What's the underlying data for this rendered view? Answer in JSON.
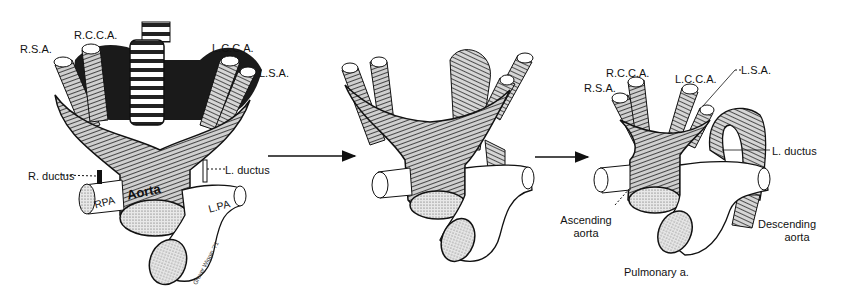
{
  "figure": {
    "panels": [
      {
        "id": "panel-1",
        "labels": {
          "rsa": "R.S.A.",
          "rcca": "R.C.C.A.",
          "lcca": "L.C.C.A.",
          "lsa": "L.S.A.",
          "r_ductus": "R. ductus",
          "l_ductus": "L. ductus",
          "aorta": "Aorta",
          "rpa": "RPA",
          "lpa": "L.PA"
        },
        "signature": "Grover Wiggin '71"
      },
      {
        "id": "panel-2",
        "labels": {}
      },
      {
        "id": "panel-3",
        "labels": {
          "rsa": "R.S.A.",
          "rcca": "R.C.C.A.",
          "lcca": "L.C.C.A.",
          "lsa": "L.S.A.",
          "l_ductus": "L. ductus",
          "ascending_aorta_1": "Ascending",
          "ascending_aorta_2": "aorta",
          "descending_aorta_1": "Descending",
          "descending_aorta_2": "aorta",
          "pulmonary": "Pulmonary a."
        }
      }
    ],
    "arrows": [
      {
        "from": "panel-1",
        "to": "panel-2"
      },
      {
        "from": "panel-2",
        "to": "panel-3"
      }
    ]
  }
}
